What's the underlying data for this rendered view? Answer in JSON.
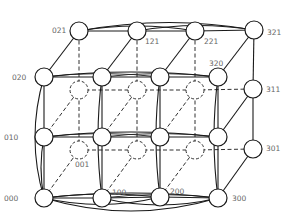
{
  "colors": {
    "line": "#1a1a1a",
    "label": "#666666",
    "node_fill": "#ffffff"
  },
  "node_radius": 9,
  "nodes": [
    {
      "id": "000",
      "x": 44,
      "y": 198,
      "hidden": false,
      "label": "000",
      "lx": 4,
      "ly": 201
    },
    {
      "id": "100",
      "x": 102,
      "y": 198,
      "hidden": false,
      "label": "100",
      "lx": 112,
      "ly": 195
    },
    {
      "id": "200",
      "x": 160,
      "y": 197,
      "hidden": false,
      "label": "200",
      "lx": 170,
      "ly": 194
    },
    {
      "id": "300",
      "x": 218,
      "y": 198,
      "hidden": false,
      "label": "300",
      "lx": 232,
      "ly": 201
    },
    {
      "id": "010",
      "x": 44,
      "y": 137,
      "hidden": false,
      "label": "010",
      "lx": 4,
      "ly": 140
    },
    {
      "id": "110",
      "x": 102,
      "y": 137,
      "hidden": false,
      "label": "",
      "lx": 0,
      "ly": 0
    },
    {
      "id": "210",
      "x": 160,
      "y": 137,
      "hidden": false,
      "label": "",
      "lx": 0,
      "ly": 0
    },
    {
      "id": "310",
      "x": 218,
      "y": 137,
      "hidden": false,
      "label": "",
      "lx": 0,
      "ly": 0
    },
    {
      "id": "020",
      "x": 44,
      "y": 77,
      "hidden": false,
      "label": "020",
      "lx": 12,
      "ly": 80
    },
    {
      "id": "120",
      "x": 102,
      "y": 77,
      "hidden": false,
      "label": "",
      "lx": 0,
      "ly": 0
    },
    {
      "id": "220",
      "x": 160,
      "y": 77,
      "hidden": false,
      "label": "",
      "lx": 0,
      "ly": 0
    },
    {
      "id": "320",
      "x": 218,
      "y": 77,
      "hidden": false,
      "label": "320",
      "lx": 209,
      "ly": 66
    },
    {
      "id": "001",
      "x": 79,
      "y": 150,
      "hidden": true,
      "label": "001",
      "lx": 75,
      "ly": 167
    },
    {
      "id": "101",
      "x": 137,
      "y": 150,
      "hidden": true,
      "label": "",
      "lx": 0,
      "ly": 0
    },
    {
      "id": "201",
      "x": 195,
      "y": 150,
      "hidden": true,
      "label": "",
      "lx": 0,
      "ly": 0
    },
    {
      "id": "301",
      "x": 253,
      "y": 149,
      "hidden": false,
      "label": "301",
      "lx": 266,
      "ly": 151
    },
    {
      "id": "011",
      "x": 79,
      "y": 90,
      "hidden": true,
      "label": "",
      "lx": 0,
      "ly": 0
    },
    {
      "id": "111",
      "x": 137,
      "y": 90,
      "hidden": true,
      "label": "",
      "lx": 0,
      "ly": 0
    },
    {
      "id": "211",
      "x": 195,
      "y": 90,
      "hidden": true,
      "label": "",
      "lx": 0,
      "ly": 0
    },
    {
      "id": "311",
      "x": 253,
      "y": 89,
      "hidden": false,
      "label": "311",
      "lx": 266,
      "ly": 92
    },
    {
      "id": "021",
      "x": 79,
      "y": 31,
      "hidden": false,
      "label": "021",
      "lx": 52,
      "ly": 33
    },
    {
      "id": "121",
      "x": 137,
      "y": 31,
      "hidden": false,
      "label": "121",
      "lx": 145,
      "ly": 44
    },
    {
      "id": "221",
      "x": 195,
      "y": 31,
      "hidden": false,
      "label": "221",
      "lx": 204,
      "ly": 44
    },
    {
      "id": "321",
      "x": 254,
      "y": 30,
      "hidden": false,
      "label": "321",
      "lx": 267,
      "ly": 35
    }
  ]
}
